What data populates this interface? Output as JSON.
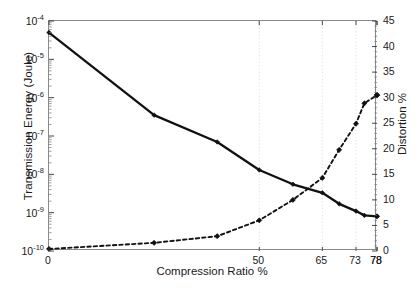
{
  "chart_data": {
    "type": "line",
    "title": "",
    "xlabel": "Compression Ratio %",
    "ylabel": "Transmission Energy (Joule)",
    "ylabel_right": "Distortion %",
    "grid": true,
    "legend": null,
    "x": [
      0,
      25,
      40,
      50,
      58,
      65,
      69,
      73,
      75,
      78,
      78,
      78
    ],
    "xtick_positions": [
      0,
      50,
      65,
      73,
      78,
      78
    ],
    "xticklabels": [
      "0",
      "50",
      "65",
      "73",
      "78",
      "78"
    ],
    "xlim": [
      0,
      78
    ],
    "left_axis": {
      "scale": "log",
      "ylim": [
        1e-10,
        0.0001
      ],
      "ytick_bases": [
        "10",
        "10",
        "10",
        "10",
        "10",
        "10",
        "10"
      ],
      "ytick_exponents": [
        "-4",
        "-5",
        "-6",
        "-7",
        "-8",
        "-9",
        "-10"
      ],
      "yticklabels": [
        "10^-4",
        "10^-5",
        "10^-6",
        "10^-7",
        "10^-8",
        "10^-9",
        "10^-10"
      ]
    },
    "right_axis": {
      "scale": "linear",
      "ylim": [
        0,
        45
      ],
      "yticks": [
        0,
        5,
        10,
        15,
        20,
        25,
        30,
        35,
        40,
        45
      ],
      "yticklabels": [
        "0",
        "5",
        "10",
        "15",
        "20",
        "25",
        "30",
        "35",
        "40",
        "45"
      ]
    },
    "series": [
      {
        "name": "Transmission Energy (Joule)",
        "axis": "left",
        "linestyle": "solid",
        "color": "#111111",
        "marker": "diamond",
        "values": [
          5e-05,
          3.5e-07,
          7e-08,
          1.3e-08,
          5.5e-09,
          3.3e-09,
          1.7e-09,
          1.1e-09,
          8.5e-10,
          8e-10,
          8e-10,
          8.2e-10
        ]
      },
      {
        "name": "Distortion %",
        "axis": "right",
        "linestyle": "dashed",
        "color": "#111111",
        "marker": "diamond",
        "values": [
          0.4,
          1.6,
          2.9,
          6.0,
          10.0,
          14.3,
          19.8,
          24.9,
          28.9,
          30.5,
          30.5,
          30.5
        ]
      }
    ]
  },
  "axes": {
    "xlabel": "Compression Ratio %",
    "ylabel_left": "Transmission Energy (Joule)",
    "ylabel_right": "Distortion %"
  }
}
